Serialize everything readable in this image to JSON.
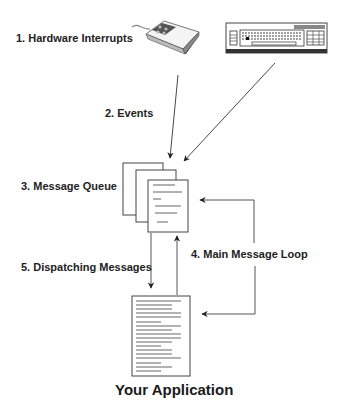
{
  "diagram": {
    "title": "Your Application",
    "steps": [
      {
        "id": "hardware-interrupts",
        "label": "1. Hardware Interrupts"
      },
      {
        "id": "events",
        "label": "2. Events"
      },
      {
        "id": "message-queue",
        "label": "3. Message Queue"
      },
      {
        "id": "main-message-loop",
        "label": "4. Main Message Loop"
      },
      {
        "id": "dispatching-messages",
        "label": "5. Dispatching Messages"
      }
    ],
    "nodes": [
      {
        "id": "mouse",
        "icon": "mouse-icon"
      },
      {
        "id": "keyboard",
        "icon": "keyboard-icon"
      },
      {
        "id": "message-queue",
        "icon": "stacked-documents-icon"
      },
      {
        "id": "application",
        "icon": "document-icon",
        "label": "Your Application"
      }
    ],
    "edges": [
      {
        "from": "mouse",
        "to": "message-queue"
      },
      {
        "from": "keyboard",
        "to": "message-queue"
      },
      {
        "from": "message-queue",
        "to": "application",
        "label": "5. Dispatching Messages"
      },
      {
        "from": "application",
        "to": "message-queue"
      },
      {
        "from": "loop",
        "to": "message-queue",
        "label": "4. Main Message Loop"
      },
      {
        "from": "loop",
        "to": "application"
      }
    ]
  }
}
